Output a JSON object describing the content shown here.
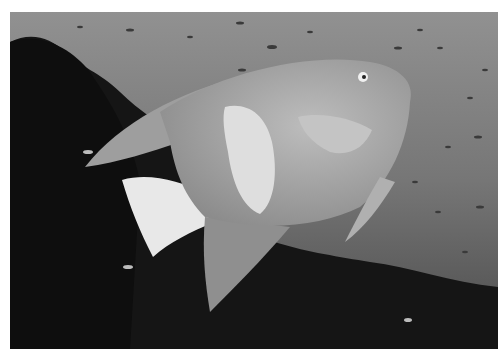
{
  "image": {
    "subject": "angelfish swimming over coral reef",
    "style": "grayscale underwater photograph",
    "colors": {
      "background": "#ffffff",
      "water_light": "#8c8c8c",
      "water_dark": "#3a3a3a",
      "reef": "#141414",
      "fish_body": "#a9a9a9",
      "fish_highlight": "#e6e6e6"
    }
  }
}
